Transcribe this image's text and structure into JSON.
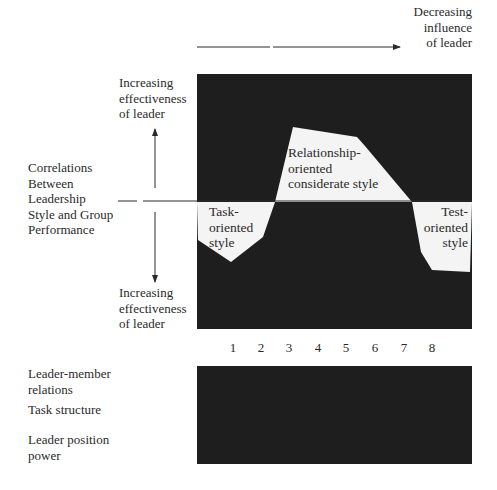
{
  "top_axis": {
    "label": "Decreasing\ninfluence\nof leader"
  },
  "left_axis": {
    "upper_label": "Increasing\neffectiveness\nof leader",
    "center_label": "Correlations\nBetween\nLeadership\nStyle and Group\nPerformance",
    "lower_label": "Increasing\neffectiveness\nof leader"
  },
  "regions": {
    "task": "Task-\noriented\nstyle",
    "relationship": "Relationship-\noriented\nconsiderate style",
    "test": "Test-\noriented\nstyle"
  },
  "octants": [
    "1",
    "2",
    "3",
    "4",
    "5",
    "6",
    "7",
    "8"
  ],
  "situation_factors": {
    "leader_member": "Leader-member\nrelations",
    "task_structure": "Task structure",
    "position_power": "Leader position\npower"
  },
  "colors": {
    "panel": "#1e1e1e",
    "shape": "#f4f4f4",
    "ink": "#2a2a2a"
  }
}
